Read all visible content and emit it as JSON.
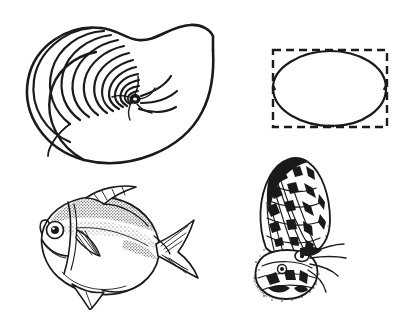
{
  "plate": {
    "title": "Natural form illustration plate",
    "background_color": "#ffffff",
    "ink_color": "#1a1a1a",
    "width": 412,
    "height": 318,
    "figure_count": 4,
    "caption": ""
  },
  "figures": [
    {
      "id": "nautilus-shell",
      "name": "Nautilus shell cross-section",
      "kind": "line-drawing",
      "description": "Sectioned chambered nautilus shell showing logarithmic spiral septa and flared aperture",
      "stroke_color": "#1a1a1a",
      "fill_color": "#ffffff",
      "chamber_count": 17,
      "position": "top-left"
    },
    {
      "id": "ellipse-in-rectangle",
      "name": "Ellipse inscribed in dashed rectangle",
      "kind": "geometric-diagram",
      "description": "Slightly tilted egg-shaped ellipse drawn tangent inside a dashed bounding rectangle",
      "stroke_color": "#1a1a1a",
      "rect_style": "dashed",
      "rect_width": 114,
      "rect_height": 76,
      "position": "top-right"
    },
    {
      "id": "pompano-fish",
      "name": "Pompano / moonfish",
      "kind": "stipple-engraving",
      "description": "Deep-bodied fish facing left with forked caudal fin, long dorsal and anal fins, stippled scale shading",
      "stroke_color": "#1a1a1a",
      "facing": "left",
      "position": "bottom-left"
    },
    {
      "id": "butterfly",
      "name": "Butterfly with patterned wing",
      "kind": "stipple-engraving",
      "description": "Side view of a butterfly with a large checkered forewing raised above a patterned body",
      "stroke_color": "#1a1a1a",
      "position": "bottom-right"
    }
  ]
}
